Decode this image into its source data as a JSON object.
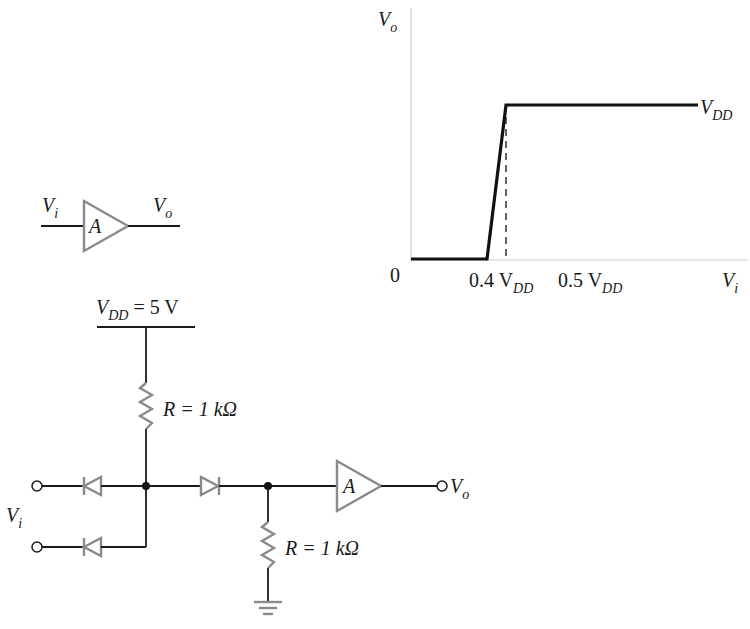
{
  "graph": {
    "y_axis_label": {
      "main": "V",
      "sub": "o"
    },
    "x_axis_label": {
      "main": "V",
      "sub": "i"
    },
    "origin_label": "0",
    "tick_04": {
      "main": "0.4 V",
      "sub": "DD"
    },
    "tick_05": {
      "main": "0.5 V",
      "sub": "DD"
    },
    "plateau_label": {
      "main": "V",
      "sub": "DD"
    }
  },
  "chart_data": {
    "type": "line",
    "xlabel": "Vi",
    "ylabel": "Vo",
    "x_units": "VDD",
    "y_units": "VDD",
    "xlim": [
      0,
      0.85
    ],
    "ylim": [
      0,
      1.35
    ],
    "x_ticks": [
      "0",
      "0.4 VDD",
      "0.5 VDD"
    ],
    "series": [
      {
        "name": "Vo",
        "x": [
          0,
          0.4,
          0.5,
          0.85
        ],
        "y": [
          0,
          0,
          1,
          1
        ]
      }
    ],
    "annotations": [
      "VDD (plateau)",
      "dashed marker at 0.5 VDD"
    ],
    "grid": false
  },
  "buffer_symbol": {
    "input_label": {
      "main": "V",
      "sub": "i"
    },
    "output_label": {
      "main": "V",
      "sub": "o"
    },
    "gain_label": "A"
  },
  "circuit": {
    "supply_label": {
      "main": "V",
      "sub": "DD",
      "rest": " = 5 V"
    },
    "pullup_resistor_label": "R = 1 kΩ",
    "pulldown_resistor_label": "R = 1 kΩ",
    "input_label": {
      "main": "V",
      "sub": "i"
    },
    "output_label": {
      "main": "V",
      "sub": "o"
    },
    "buffer_label": "A"
  }
}
